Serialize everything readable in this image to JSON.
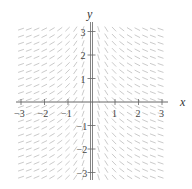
{
  "chart_data": {
    "type": "slope_field",
    "title": "",
    "equation": "dy/dx = -1/x",
    "xlabel": "x",
    "ylabel": "y",
    "xlim": [
      -3,
      3
    ],
    "ylim": [
      -3,
      3
    ],
    "x_ticks": [
      -3,
      -2,
      -1,
      1,
      2,
      3
    ],
    "y_ticks": [
      -3,
      -2,
      -1,
      1,
      2,
      3
    ],
    "x_tick_labels": [
      "−3",
      "−2",
      "−1",
      "1",
      "2",
      "3"
    ],
    "y_tick_labels": [
      "−3",
      "−2",
      "−1",
      "1",
      "2",
      "3"
    ],
    "grid": false,
    "field": {
      "x_range": [
        -3.0,
        3.0
      ],
      "y_range": [
        -3.2,
        3.2
      ],
      "x_step": 0.33,
      "y_step": 0.3,
      "segment_length": 0.26
    },
    "colors": {
      "axis": "#666666",
      "segment": "#bdbdbd",
      "text": "#333333"
    }
  },
  "layout": {
    "origin_px": [
      91.5,
      102
    ],
    "unit_px": 23.5
  }
}
